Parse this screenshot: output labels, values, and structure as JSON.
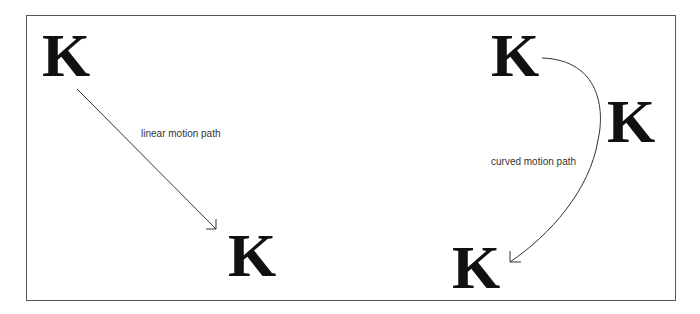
{
  "diagram": {
    "linear": {
      "start_glyph": "K",
      "end_glyph": "K",
      "label": "linear motion path"
    },
    "curved": {
      "start_glyph": "K",
      "mid_glyph": "K",
      "end_glyph": "K",
      "label": "curved motion path"
    },
    "colors": {
      "stroke": "#333333",
      "glyph": "#111111",
      "frame": "#555555",
      "background": "#ffffff"
    }
  }
}
